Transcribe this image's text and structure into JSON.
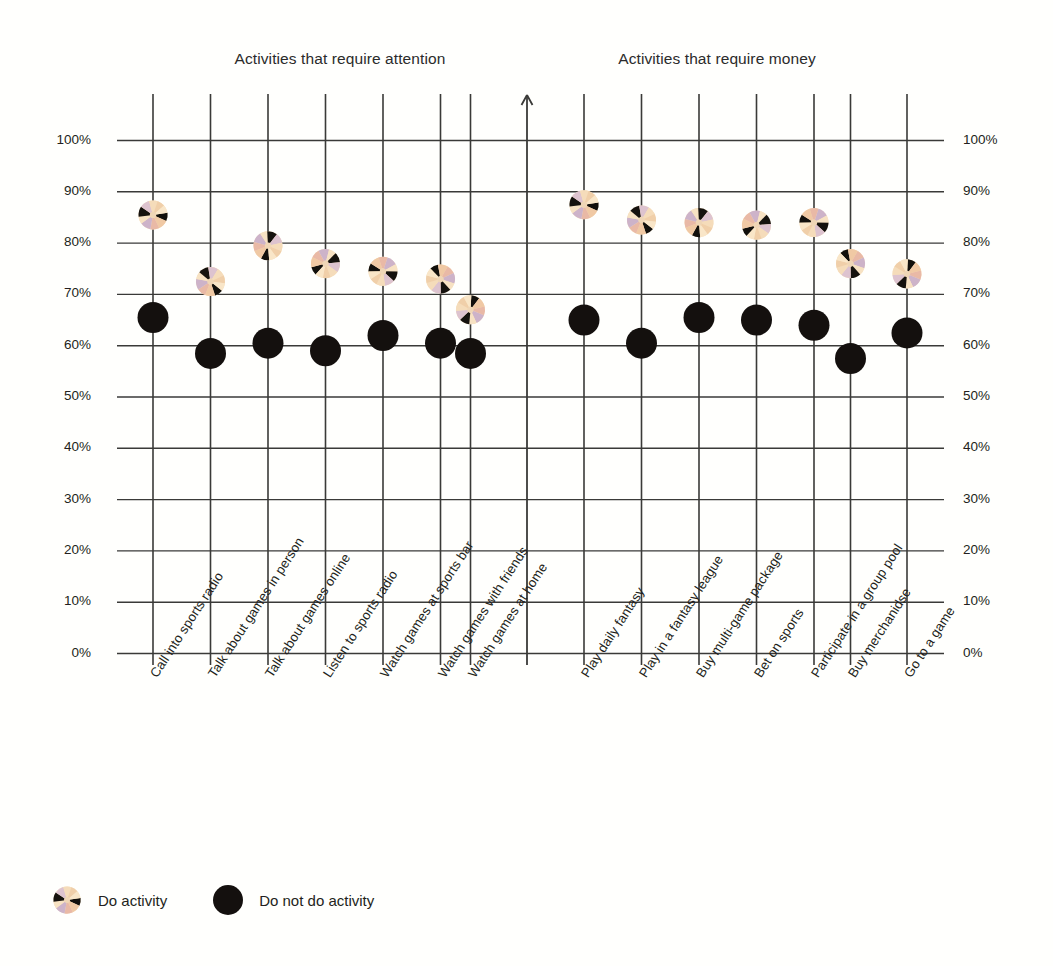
{
  "chart_data": {
    "type": "scatter",
    "title": "",
    "panels": [
      {
        "title": "Activities that require attention",
        "categories": [
          "Call into sports radio",
          "Talk about games in person",
          "Talk about games online",
          "Listen to sports radio",
          "Watch games at sports bar",
          "Watch games with friends",
          "Watch games at home"
        ],
        "series": [
          {
            "name": "Do activity",
            "values": [
              85.5,
              72.5,
              79.5,
              76.0,
              74.5,
              73.0,
              67.0
            ]
          },
          {
            "name": "Do not do activity",
            "values": [
              65.5,
              58.5,
              60.5,
              59.0,
              62.0,
              60.5,
              58.5
            ]
          }
        ]
      },
      {
        "title": "Activities that require money",
        "categories": [
          "Play daily fantasy",
          "Play in a fantasy league",
          "Buy multi-game package",
          "Bet on sports",
          "Participate in a group pool",
          "Buy merchanidse",
          "Go to a game"
        ],
        "series": [
          {
            "name": "Do activity",
            "values": [
              87.5,
              84.5,
              84.0,
              83.5,
              84.0,
              76.0,
              74.0
            ]
          },
          {
            "name": "Do not do activity",
            "values": [
              65.0,
              60.5,
              65.5,
              65.0,
              64.0,
              57.5,
              62.5
            ]
          }
        ]
      }
    ],
    "ylabel": "",
    "xlabel": "",
    "ylim": [
      0,
      100
    ],
    "ytick_labels": [
      "100%",
      "90%",
      "80%",
      "70%",
      "60%",
      "50%",
      "40%",
      "30%",
      "20%",
      "10%",
      "0%"
    ],
    "ytick_values": [
      100,
      90,
      80,
      70,
      60,
      50,
      40,
      30,
      20,
      10,
      0
    ],
    "yaxis_positions": [
      "left",
      "right"
    ],
    "grid": true,
    "legend": {
      "position": "bottom-left",
      "entries": [
        {
          "label": "Do activity",
          "marker": "pinwheel-marker",
          "color": "#f3d9b4"
        },
        {
          "label": "Do not do activity",
          "marker": "filled-circle-marker",
          "color": "#14100e"
        }
      ]
    },
    "annotations": [
      {
        "name": "up-arrow-divider",
        "description": "upward arrow atop the center divider line"
      }
    ]
  },
  "colors": {
    "background": "#fffffd",
    "gridline": "#3a3a38",
    "text": "#231f20",
    "marker_dark": "#14100e",
    "marker_cream": "#f6dfbd",
    "marker_peach": "#f3c7a8",
    "marker_lavender": "#cbb4cb"
  }
}
